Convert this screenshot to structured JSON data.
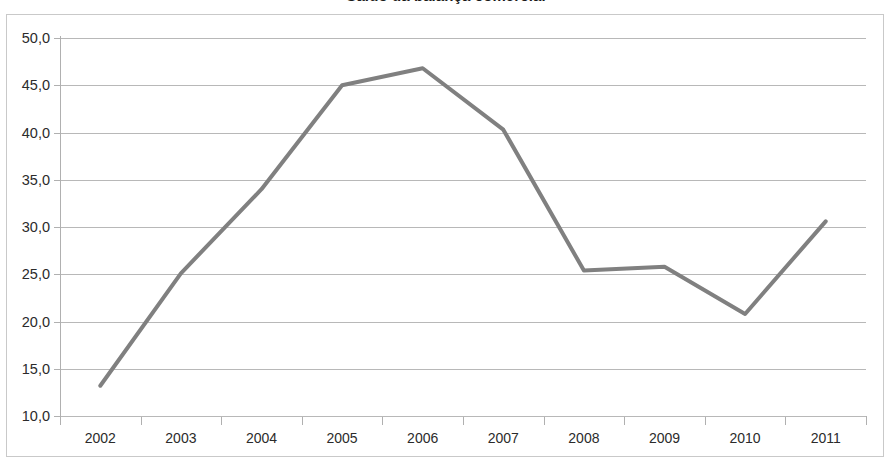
{
  "chart_data": {
    "type": "line",
    "title": "Saldo da balança comercial",
    "xlabel": "",
    "ylabel": "",
    "categories": [
      "2002",
      "2003",
      "2004",
      "2005",
      "2006",
      "2007",
      "2008",
      "2009",
      "2010",
      "2011"
    ],
    "series": [
      {
        "name": "Saldo",
        "values": [
          13.2,
          25.1,
          34.0,
          45.0,
          46.8,
          40.3,
          25.4,
          25.8,
          20.8,
          30.6
        ],
        "color": "#808080"
      }
    ],
    "ylim": [
      10.0,
      50.0
    ],
    "ytick_values": [
      50.0,
      45.0,
      40.0,
      35.0,
      30.0,
      25.0,
      20.0,
      15.0,
      10.0
    ],
    "ytick_labels": [
      "50,0",
      "45,0",
      "40,0",
      "35,0",
      "30,0",
      "25,0",
      "20,0",
      "15,0",
      "10,0"
    ],
    "grid": true,
    "legend": false,
    "legend_position": "none",
    "decimal_separator": ",",
    "gridline_color": "#b8b8b8",
    "axis_color": "#b0b0b0",
    "border_color": "#c9c9c9",
    "background_color": "#ffffff",
    "text_color": "#2b2b2b"
  }
}
